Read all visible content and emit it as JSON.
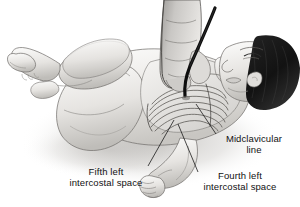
{
  "figure": {
    "style": "grayscale medical line drawing",
    "background_color": "#ffffff",
    "ink_color": "#111111",
    "hair_color": "#1a1a1a",
    "needle_color": "#0d0d0d",
    "skin_light": "#f2f1ef",
    "skin_mid": "#d9d7d4",
    "skin_shadow": "#a9a7a4",
    "shadow_color": "#cfcdca"
  },
  "labels": {
    "fifth": {
      "line1": "Fifth left",
      "line2": "intercostal space"
    },
    "midclavicular": {
      "line1": "Midclavicular",
      "line2": "line"
    },
    "fourth": {
      "line1": "Fourth left",
      "line2": "intercostal space"
    }
  },
  "scene": {
    "subject": "infant",
    "position": "supine, head to the right",
    "hand": "clinician hand holding needle",
    "needle": "needle inserted into left chest",
    "visible_anatomy": [
      "rib cage",
      "left arm with clenched fist",
      "legs flexed",
      "head with dark hair"
    ]
  },
  "leader_lines": [
    {
      "name": "fifth-intercostal-leader",
      "from_label": "fifth",
      "to": "left lower rib space"
    },
    {
      "name": "midclavicular-leader",
      "from_label": "midclavicular",
      "to": "upper chest midclavicular point"
    },
    {
      "name": "fourth-intercostal-leader",
      "from_label": "fourth",
      "to": "fourth rib space"
    }
  ]
}
